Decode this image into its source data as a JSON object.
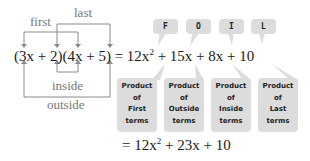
{
  "labels": {
    "first": "first",
    "last": "last",
    "inside": "inside",
    "outside": "outside"
  },
  "equation": {
    "lhs": "(3x + 2)(4x + 5)",
    "expansion_prefix": "= 12x",
    "expansion_rest": " + 15x + 8x + 10",
    "result_prefix": "= 12x",
    "result_rest": " + 23x + 10",
    "exponent": "2"
  },
  "foil_tags": [
    "F",
    "O",
    "I",
    "L"
  ],
  "product_boxes": [
    {
      "line1": "Product",
      "line2": "of",
      "line3": "First",
      "line4": "terms"
    },
    {
      "line1": "Product",
      "line2": "of",
      "line3": "Outside",
      "line4": "terms"
    },
    {
      "line1": "Product",
      "line2": "of",
      "line3": "Inside",
      "line4": "terms"
    },
    {
      "line1": "Product",
      "line2": "of",
      "line3": "Last",
      "line4": "terms"
    }
  ]
}
